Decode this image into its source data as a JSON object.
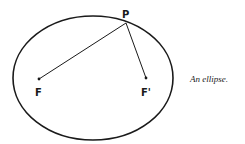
{
  "figure": {
    "caption": "An ellipse.",
    "labels": {
      "point": "P",
      "focus1": "F",
      "focus2": "F'"
    },
    "colors": {
      "stroke": "#1a1a1a",
      "background": "#ffffff"
    },
    "geometry": {
      "ellipse": {
        "cx": 93,
        "cy": 78,
        "rx": 80,
        "ry": 62
      },
      "P": [
        126,
        23
      ],
      "F": [
        39,
        79
      ],
      "F_prime": [
        146,
        78
      ]
    }
  }
}
